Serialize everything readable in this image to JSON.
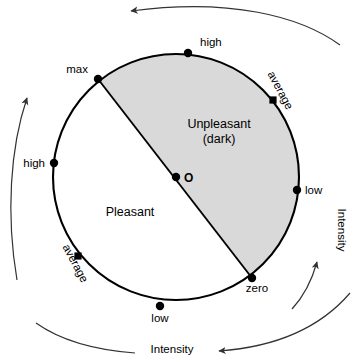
{
  "diagram": {
    "colors": {
      "stroke": "#000000",
      "outer_arc_stroke": "#333333",
      "shaded_fill": "#d9d9d9",
      "unshaded_fill": "#ffffff",
      "background": "#ffffff",
      "text": "#000000"
    },
    "circle": {
      "center_x": 176,
      "center_y": 177,
      "radius": 123
    },
    "regions": [
      {
        "name": "unpleasant",
        "label_line1": "Unpleasant",
        "label_line2": "(dark)",
        "fill": "shaded",
        "label_x": 219,
        "label_y": 128
      },
      {
        "name": "pleasant",
        "label_line1": "Pleasant",
        "label_line2": "",
        "fill": "unshaded",
        "label_x": 130,
        "label_y": 216
      }
    ],
    "center_point": {
      "label": "O",
      "x": 176,
      "y": 177,
      "label_x": 184,
      "label_y": 181
    },
    "boundary_points": [
      {
        "name": "max",
        "label": "max",
        "x": 98,
        "y": 79,
        "label_x": 88,
        "label_y": 73,
        "anchor": "end",
        "rotation": 0
      },
      {
        "name": "zero",
        "label": "zero",
        "x": 252,
        "y": 278,
        "label_x": 257,
        "label_y": 292,
        "anchor": "middle",
        "rotation": 0
      },
      {
        "name": "high-top",
        "label": "high",
        "x": 188,
        "y": 53,
        "label_x": 200,
        "label_y": 46,
        "anchor": "start",
        "rotation": 0
      },
      {
        "name": "high-left",
        "label": "high",
        "x": 54,
        "y": 163,
        "label_x": 45,
        "label_y": 167,
        "anchor": "end",
        "rotation": 0
      },
      {
        "name": "low-right",
        "label": "low",
        "x": 297,
        "y": 190,
        "label_x": 305,
        "label_y": 194,
        "anchor": "start",
        "rotation": 0
      },
      {
        "name": "low-bottom",
        "label": "low",
        "x": 160,
        "y": 306,
        "label_x": 160,
        "label_y": 322,
        "anchor": "middle",
        "rotation": 0
      },
      {
        "name": "average-upper-right",
        "label": "average",
        "x": 273,
        "y": 100,
        "label_x": 277,
        "label_y": 92,
        "anchor": "middle",
        "rotation": 62
      },
      {
        "name": "average-lower-left",
        "label": "average",
        "x": 78,
        "y": 256,
        "label_x": 72,
        "label_y": 265,
        "anchor": "middle",
        "rotation": 62
      }
    ],
    "axes": [
      {
        "name": "intensity-right",
        "label": "Intensity",
        "label_x": 338,
        "label_y": 230,
        "rotation": 90,
        "arrow_direction": "up"
      },
      {
        "name": "intensity-bottom",
        "label": "Intensity",
        "label_x": 172,
        "label_y": 353,
        "rotation": 0,
        "arrow_direction": "left"
      }
    ]
  }
}
